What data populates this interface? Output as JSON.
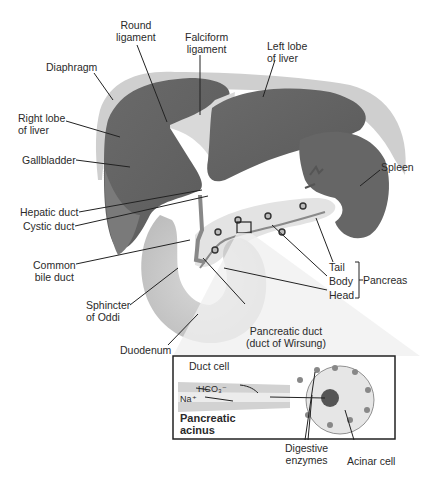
{
  "figure": {
    "title": "",
    "labels": {
      "round_ligament": "Round\nligament",
      "falciform_ligament": "Falciform\nligament",
      "left_lobe": "Left lobe\nof liver",
      "diaphragm": "Diaphragm",
      "right_lobe": "Right lobe\nof liver",
      "gallbladder": "Gallbladder",
      "spleen": "Spleen",
      "hepatic_duct": "Hepatic duct",
      "cystic_duct": "Cystic duct",
      "common_bile_duct": "Common\nbile duct",
      "tail": "Tail",
      "body": "Body",
      "head": "Head",
      "pancreas": "Pancreas",
      "sphincter_of_oddi": "Sphincter\nof Oddi",
      "pancreatic_duct": "Pancreatic duct\n(duct of Wirsung)",
      "duodenum": "Duodenum"
    },
    "inset": {
      "duct_cell": "Duct cell",
      "hco3": "HCO₃⁻",
      "na": "Na⁺",
      "title": "Pancreatic\nacinus",
      "digestive_enzymes": "Digestive\nenzymes",
      "acinar_cell": "Acinar cell"
    }
  }
}
